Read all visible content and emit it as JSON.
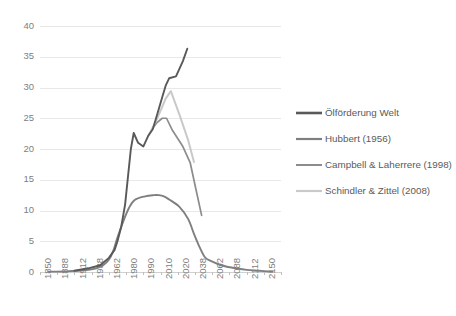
{
  "chart_data": {
    "type": "line",
    "title": "",
    "xlabel": "",
    "ylabel": "",
    "ylim": [
      0,
      40
    ],
    "ytick_values": [
      0,
      5,
      10,
      15,
      20,
      25,
      30,
      35,
      40
    ],
    "ytick_labels": [
      "0",
      "5",
      "10",
      "15",
      "20",
      "25",
      "30",
      "35",
      "40"
    ],
    "grid": "horizontal",
    "legend_position": "right",
    "categories": [
      1850,
      1888,
      1912,
      1938,
      1962,
      1980,
      1990,
      2010,
      2020,
      2038,
      2062,
      2088,
      2112,
      2150
    ],
    "xtick_labels": [
      "1850",
      "1888",
      "1912",
      "1938",
      "1962",
      "1980",
      "1990",
      "2010",
      "2020",
      "2038",
      "2062",
      "2088",
      "2112",
      "2150"
    ],
    "series": [
      {
        "name": "Ölförderung Welt",
        "color": "#595959",
        "width": 1.9,
        "x": [
          1900,
          1920,
          1938,
          1950,
          1958,
          1962,
          1966,
          1970,
          1973,
          1976,
          1979,
          1982,
          1985,
          1988,
          1991,
          1994,
          1998,
          2002,
          2006,
          2010,
          2014,
          2018,
          2021
        ],
        "values": [
          0.2,
          0.6,
          1.1,
          2.3,
          3.6,
          5.0,
          7.4,
          11.0,
          15.5,
          20.0,
          22.6,
          21.0,
          20.4,
          22.2,
          23.2,
          24.6,
          26.5,
          28.4,
          30.3,
          31.5,
          31.8,
          34.3,
          36.3
        ]
      },
      {
        "name": "Hubbert (1956)",
        "color": "#7f7f7f",
        "width": 1.9,
        "x": [
          1850,
          1888,
          1905,
          1920,
          1932,
          1942,
          1950,
          1956,
          1962,
          1968,
          1974,
          1980,
          1986,
          1992,
          1998,
          2004,
          2010,
          2016,
          2022,
          2028,
          2034,
          2040,
          2048,
          2058,
          2070,
          2085,
          2100,
          2120,
          2150
        ],
        "values": [
          0.05,
          0.1,
          0.2,
          0.35,
          0.6,
          1.1,
          2.0,
          3.4,
          5.6,
          8.2,
          10.4,
          11.7,
          12.3,
          12.5,
          12.5,
          12.3,
          11.8,
          10.6,
          8.6,
          6.2,
          4.0,
          2.4,
          1.8,
          1.3,
          0.9,
          0.6,
          0.35,
          0.2,
          0.05
        ]
      },
      {
        "name": "Campbell & Laherrere (1998)",
        "color": "#8c8c8c",
        "width": 1.7,
        "x": [
          1990,
          1996,
          2002,
          2007,
          2012,
          2018,
          2024,
          2030,
          2036
        ],
        "values": [
          23.2,
          24.3,
          25.0,
          25.0,
          23.0,
          20.4,
          17.8,
          13.5,
          9.2
        ]
      },
      {
        "name": "Schindler & Zittel (2008)",
        "color": "#c9c9c9",
        "width": 2.0,
        "x": [
          1988,
          1994,
          2000,
          2006,
          2011,
          2016,
          2022,
          2028
        ],
        "values": [
          22.2,
          24.3,
          26.2,
          28.2,
          29.4,
          25.6,
          21.4,
          17.9
        ]
      }
    ]
  },
  "legend": {
    "items": [
      {
        "label": "Ölförderung Welt",
        "color": "#595959",
        "width": 2.6
      },
      {
        "label": "Hubbert (1956)",
        "color": "#7f7f7f",
        "width": 2.2
      },
      {
        "label": "Campbell & Laherrere (1998)",
        "color": "#8c8c8c",
        "width": 2.0
      },
      {
        "label": "Schindler & Zittel (2008)",
        "color": "#c9c9c9",
        "width": 2.2
      }
    ]
  },
  "colors": {
    "background": "#ffffff",
    "grid": "#e8e8e8",
    "tick_text": "#808080",
    "legend_text": "#5a5a5a"
  }
}
